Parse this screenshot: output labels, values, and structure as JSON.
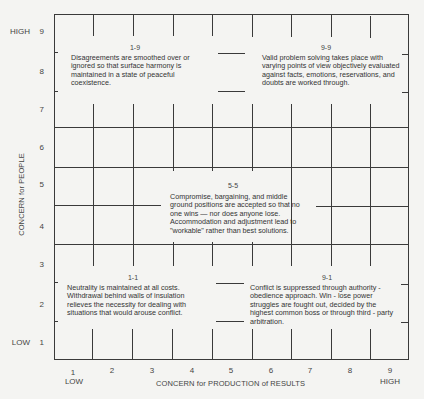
{
  "diagram": {
    "y_axis": {
      "title": "CONCERN for PEOPLE",
      "ticks": [
        "1",
        "2",
        "3",
        "4",
        "5",
        "6",
        "7",
        "8",
        "9"
      ],
      "low_label": "LOW",
      "high_label": "HIGH"
    },
    "x_axis": {
      "title": "CONCERN for PRODUCTION of RESULTS",
      "ticks": [
        "1",
        "2",
        "3",
        "4",
        "5",
        "6",
        "7",
        "8",
        "9"
      ],
      "low_label": "LOW",
      "high_label": "HIGH"
    },
    "cells": {
      "c19": {
        "label": "1-9",
        "text": "Disagreements are smoothed over or ignored so that surface harmony is maintained in a state of peaceful coexistence."
      },
      "c99": {
        "label": "9-9",
        "text": "Valid problem solving takes place with varying points of view objectively evaluated against facts, emotions, reservations, and doubts are worked through."
      },
      "c55": {
        "label": "5-5",
        "text": "Compromise, bargaining, and middle ground positions are accepted so that no one wins — nor does anyone lose. Accommodation and adjustment lead to \"workable\" rather than best solutions."
      },
      "c11": {
        "label": "1-1",
        "text": "Neutrality is maintained at all costs. Withdrawal behind walls of insulation relieves the necessity for dealing with situations that would arouse conflict."
      },
      "c91": {
        "label": "9-1",
        "text": "Conflict is suppressed through authority - obedience approach. Win - lose power struggles are fought out, decided by the highest common boss or through third - party arbitration."
      }
    }
  }
}
